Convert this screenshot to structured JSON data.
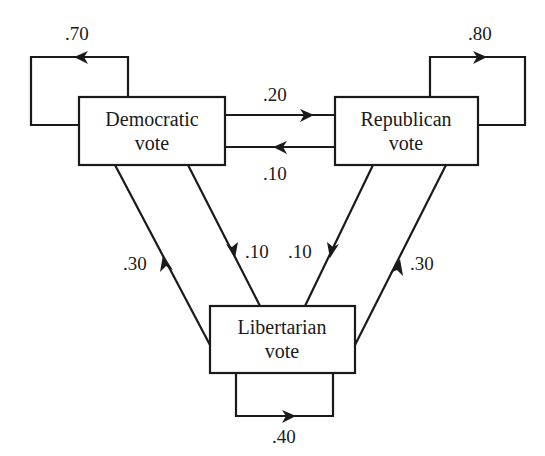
{
  "diagram": {
    "type": "state-transition",
    "nodes": {
      "democratic": {
        "line1": "Democratic",
        "line2": "vote"
      },
      "republican": {
        "line1": "Republican",
        "line2": "vote"
      },
      "libertarian": {
        "line1": "Libertarian",
        "line2": "vote"
      }
    },
    "edges": {
      "dem_to_dem": {
        "from": "Democratic vote",
        "to": "Democratic vote",
        "probability": ".70"
      },
      "dem_to_rep": {
        "from": "Democratic vote",
        "to": "Republican vote",
        "probability": ".20"
      },
      "rep_to_dem": {
        "from": "Republican vote",
        "to": "Democratic vote",
        "probability": ".10"
      },
      "rep_to_rep": {
        "from": "Republican vote",
        "to": "Republican vote",
        "probability": ".80"
      },
      "lib_to_dem": {
        "from": "Libertarian vote",
        "to": "Democratic vote",
        "probability": ".30"
      },
      "dem_to_lib": {
        "from": "Democratic vote",
        "to": "Libertarian vote",
        "probability": ".10"
      },
      "rep_to_lib": {
        "from": "Republican vote",
        "to": "Libertarian vote",
        "probability": ".10"
      },
      "lib_to_rep": {
        "from": "Libertarian vote",
        "to": "Republican vote",
        "probability": ".30"
      },
      "lib_to_lib": {
        "from": "Libertarian vote",
        "to": "Libertarian vote",
        "probability": ".40"
      }
    },
    "colors": {
      "stroke": "#1a1a1a",
      "background": "#ffffff"
    }
  }
}
